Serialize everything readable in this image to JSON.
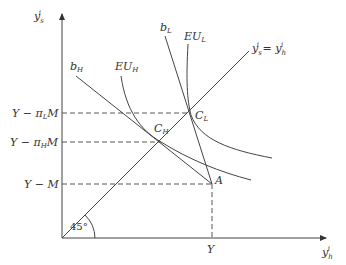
{
  "diagram": {
    "axes": {
      "y_label": "y_s^i",
      "x_label": "y_h^i",
      "y_label_base": "y",
      "y_label_sub": "s",
      "y_label_sup": "i",
      "x_label_base": "y",
      "x_label_sub": "h",
      "x_label_sup": "i"
    },
    "diagonal": {
      "label": "y_s^i = y_h^i",
      "angle_label": "45°"
    },
    "lines": {
      "b_H": "b_H",
      "b_L": "b_L"
    },
    "curves": {
      "EU_H": "EU_H",
      "EU_L": "EU_L"
    },
    "points": {
      "C_L": "C_L",
      "C_H": "C_H",
      "A": "A"
    },
    "y_ticks": [
      "Y − π_L M",
      "Y − π_H M",
      "Y − M"
    ],
    "x_ticks": [
      "Y"
    ]
  }
}
